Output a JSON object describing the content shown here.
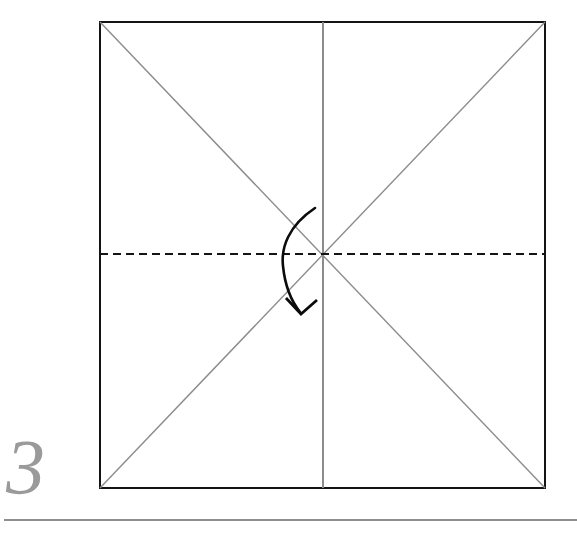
{
  "page": {
    "kind": "origami-fold-diagram",
    "width": 577,
    "height": 536,
    "background_color": "#ffffff"
  },
  "step": {
    "number": "3",
    "number_color": "#9a9a9a"
  },
  "figure": {
    "paper": {
      "shape": "square",
      "left": 100,
      "top": 22,
      "right": 545,
      "bottom": 488,
      "edge_color": "#141414",
      "edge_width": 2.2,
      "fill": "#ffffff"
    },
    "crease_lines": [
      {
        "name": "diagonal-tl-br",
        "style": "solid",
        "color": "#8c8c8c",
        "width": 1.4,
        "x1": 100,
        "y1": 22,
        "x2": 545,
        "y2": 488
      },
      {
        "name": "diagonal-bl-tr",
        "style": "solid",
        "color": "#8c8c8c",
        "width": 1.4,
        "x1": 100,
        "y1": 488,
        "x2": 545,
        "y2": 22
      },
      {
        "name": "vertical-center",
        "style": "solid",
        "color": "#8c8c8c",
        "width": 1.4,
        "x1": 323,
        "y1": 22,
        "x2": 323,
        "y2": 488
      }
    ],
    "fold_line": {
      "name": "horizontal-valley-fold",
      "style": "dashed",
      "color": "#141414",
      "width": 2.4,
      "dash": "8,5",
      "x1": 100,
      "y1": 254,
      "x2": 545,
      "y2": 254
    },
    "fold_arrow": {
      "name": "fold-down-arrow",
      "color": "#0b0b0b",
      "width": 2.6,
      "path": "M 315 208 C 288 226 281 248 283 266 C 285 286 292 302 300 312",
      "head": "M 286 298 L 301 314 L 317 300",
      "direction": "down"
    },
    "center_point": {
      "x": 323,
      "y": 254
    }
  },
  "footer_rule": {
    "name": "bottom-divider",
    "color": "#8f8f8f",
    "width": 2,
    "x1": 4,
    "y1": 520,
    "x2": 577,
    "y2": 520
  }
}
